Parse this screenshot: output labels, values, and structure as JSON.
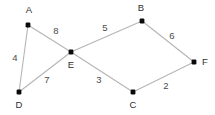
{
  "figure": {
    "kind": "weighted-undirected-graph",
    "width": 215,
    "height": 115,
    "background_color": "#ffffff",
    "edge_color": "#b5b5b5",
    "node_color": "#0a0a0a",
    "label_color": "#2e2e2e"
  },
  "nodes": [
    {
      "id": "A",
      "label": "A",
      "x": 28,
      "y": 25,
      "label_x": 29,
      "label_y": 10
    },
    {
      "id": "B",
      "label": "B",
      "x": 142,
      "y": 21,
      "label_x": 141,
      "label_y": 8
    },
    {
      "id": "C",
      "label": "C",
      "x": 133,
      "y": 92,
      "label_x": 133,
      "label_y": 105
    },
    {
      "id": "D",
      "label": "D",
      "x": 19,
      "y": 92,
      "label_x": 19,
      "label_y": 105
    },
    {
      "id": "E",
      "label": "E",
      "x": 71,
      "y": 52,
      "label_x": 71,
      "label_y": 65
    },
    {
      "id": "F",
      "label": "F",
      "x": 194,
      "y": 62,
      "label_x": 205,
      "label_y": 62
    }
  ],
  "edges": [
    {
      "id": "A-D",
      "from": "A",
      "to": "D",
      "weight": "4",
      "label_x": 15,
      "label_y": 58
    },
    {
      "id": "A-E",
      "from": "A",
      "to": "E",
      "weight": "8",
      "label_x": 56,
      "label_y": 31
    },
    {
      "id": "D-E",
      "from": "D",
      "to": "E",
      "weight": "7",
      "label_x": 47,
      "label_y": 80
    },
    {
      "id": "B-E",
      "from": "B",
      "to": "E",
      "weight": "5",
      "label_x": 105,
      "label_y": 28
    },
    {
      "id": "B-F",
      "from": "B",
      "to": "F",
      "weight": "6",
      "label_x": 172,
      "label_y": 36
    },
    {
      "id": "C-E",
      "from": "C",
      "to": "E",
      "weight": "3",
      "label_x": 99,
      "label_y": 80
    },
    {
      "id": "C-F",
      "from": "C",
      "to": "F",
      "weight": "2",
      "label_x": 166,
      "label_y": 86
    }
  ]
}
